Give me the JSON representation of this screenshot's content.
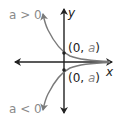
{
  "diagram": {
    "type": "exponential-graph-sketch",
    "labels": {
      "a_positive": "a > 0",
      "a_negative": "a < 0",
      "y_axis": "y",
      "x_axis": "x",
      "point_upper_prefix": "(0, ",
      "point_upper_var": "a",
      "point_upper_suffix": ")",
      "point_lower_prefix": "(0, ",
      "point_lower_var": "a",
      "point_lower_suffix": ")"
    },
    "colors": {
      "axes": "#222222",
      "curves": "#7a7a7a",
      "label_gray": "#8a8a8a"
    },
    "curves": [
      {
        "name": "a > 0",
        "y_intercept": "(0, a)",
        "asymptote": "x-axis",
        "direction": "decreasing toward x-axis"
      },
      {
        "name": "a < 0",
        "y_intercept": "(0, a)",
        "asymptote": "x-axis",
        "direction": "increasing toward x-axis"
      }
    ]
  }
}
